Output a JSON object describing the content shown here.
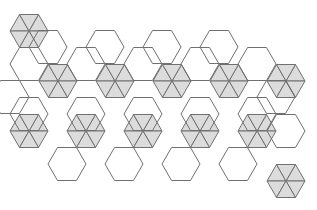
{
  "diagram": {
    "type": "polyhedron-net",
    "colors": {
      "background": "#ffffff",
      "stroke": "#707070",
      "triangle_fill": "#dcdcdc",
      "hexagon_fill": "#ffffff"
    },
    "edge": 19,
    "hexagons": [
      [
        29,
        64
      ],
      [
        86,
        64
      ],
      [
        143,
        64
      ],
      [
        200,
        64
      ],
      [
        257,
        64
      ],
      [
        29,
        114
      ],
      [
        86,
        114
      ],
      [
        143,
        114
      ],
      [
        200,
        114
      ],
      [
        257,
        114
      ],
      [
        286,
        131
      ],
      [
        67,
        164
      ],
      [
        124,
        164
      ],
      [
        181,
        164
      ],
      [
        238,
        164
      ],
      [
        10,
        97
      ],
      [
        48,
        47
      ],
      [
        105,
        47
      ],
      [
        162,
        47
      ],
      [
        219,
        47
      ],
      [
        276,
        97
      ]
    ],
    "triangle_clusters": [
      [
        29,
        31
      ],
      [
        58,
        81
      ],
      [
        115,
        81
      ],
      [
        172,
        81
      ],
      [
        229,
        81
      ],
      [
        286,
        81
      ],
      [
        29,
        131
      ],
      [
        86,
        131
      ],
      [
        143,
        131
      ],
      [
        200,
        131
      ],
      [
        257,
        131
      ],
      [
        286,
        181
      ]
    ]
  }
}
